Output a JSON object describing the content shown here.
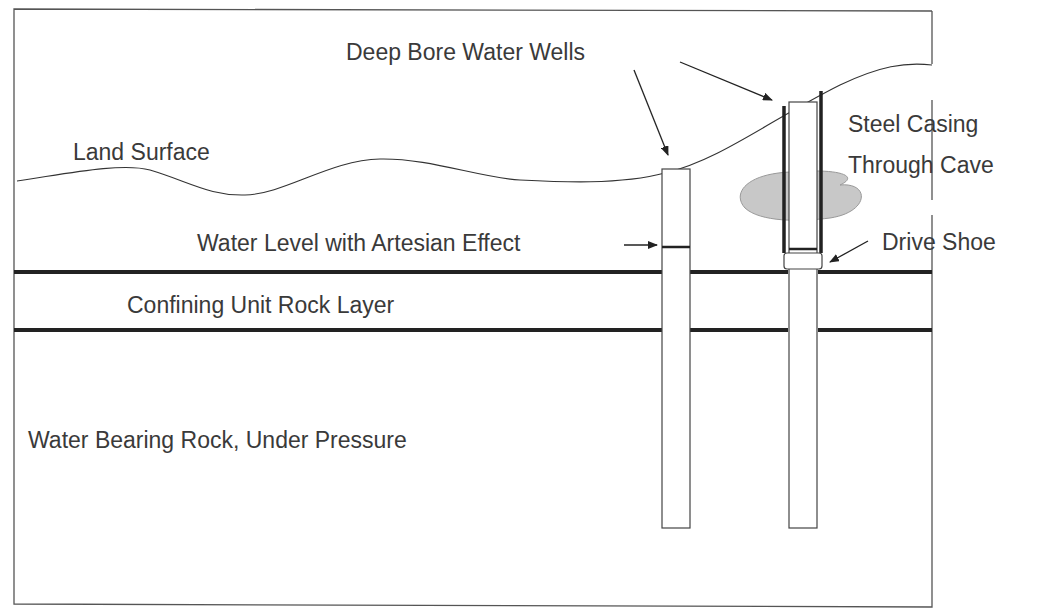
{
  "diagram": {
    "labels": {
      "deep_bore_wells": "Deep Bore Water Wells",
      "land_surface": "Land Surface",
      "steel_casing_line1": "Steel Casing",
      "steel_casing_line2": "Through Cave",
      "water_level": "Water Level with Artesian Effect",
      "drive_shoe": "Drive Shoe",
      "confining_unit": "Confining Unit Rock Layer",
      "water_bearing": "Water Bearing Rock, Under Pressure"
    },
    "colors": {
      "line": "#2a2a2a",
      "text": "#3a3a3a",
      "cave_fill": "#c8c8c8",
      "frame": "#555555"
    }
  }
}
